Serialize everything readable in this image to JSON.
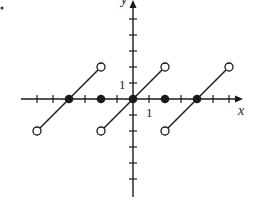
{
  "chart_data": {
    "type": "line",
    "title": "",
    "xlabel": "x",
    "ylabel": "y",
    "tick_label_x": "1",
    "tick_label_y": "1",
    "xlim": [
      -7,
      7
    ],
    "ylim": [
      -6,
      6
    ],
    "grid": false,
    "x_ticks": [
      -6,
      -5,
      -4,
      -3,
      -2,
      -1,
      1,
      2,
      3,
      4,
      5,
      6
    ],
    "y_ticks": [
      -5,
      -4,
      -3,
      -2,
      -1,
      1,
      2,
      3,
      4,
      5
    ],
    "series": [
      {
        "name": "segment-1",
        "x": [
          -6,
          -2
        ],
        "y": [
          -2,
          2
        ],
        "endpoints": "open"
      },
      {
        "name": "segment-2",
        "x": [
          -2,
          2
        ],
        "y": [
          -2,
          2
        ],
        "endpoints": "open"
      },
      {
        "name": "segment-3",
        "x": [
          2,
          6
        ],
        "y": [
          -2,
          2
        ],
        "endpoints": "open"
      }
    ],
    "filled_points": [
      {
        "x": -4,
        "y": 0
      },
      {
        "x": -2,
        "y": 0
      },
      {
        "x": 0,
        "y": 0
      },
      {
        "x": 2,
        "y": 0
      },
      {
        "x": 4,
        "y": 0
      }
    ],
    "open_points": [
      {
        "x": -6,
        "y": -2
      },
      {
        "x": -2,
        "y": 2
      },
      {
        "x": -2,
        "y": -2
      },
      {
        "x": 2,
        "y": 2
      },
      {
        "x": 2,
        "y": -2
      },
      {
        "x": 6,
        "y": 2
      }
    ]
  },
  "layout": {
    "origin_px": [
      133,
      99
    ],
    "unit_px": 16,
    "x_axis_px": [
      21,
      243
    ],
    "y_axis_px": [
      0,
      197
    ],
    "line_color": "#1a1a1a"
  }
}
